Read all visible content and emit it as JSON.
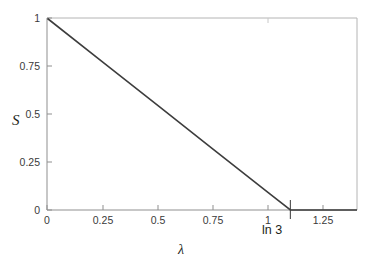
{
  "chart_data": {
    "type": "line",
    "title": "",
    "subtitle": "",
    "xlabel": "λ",
    "ylabel": "S",
    "xlim": [
      0,
      1.4
    ],
    "ylim": [
      0,
      1
    ],
    "grid": false,
    "legend": null,
    "xticks": [
      0,
      0.25,
      0.5,
      0.75,
      1,
      1.25
    ],
    "xticklabels": [
      "0",
      "0.25",
      "0.5",
      "0.75",
      "1",
      "1.25"
    ],
    "yticks": [
      0,
      0.25,
      0.5,
      0.75,
      1
    ],
    "yticklabels": [
      "0",
      "0.25",
      "0.5",
      "0.75",
      "1"
    ],
    "annotations": [
      {
        "text": "ln 3",
        "x": 1.0986,
        "y": 0,
        "note": "tick marking the kink where S reaches zero"
      }
    ],
    "series": [
      {
        "name": "S(λ)",
        "color": "#3d3d3d",
        "linewidth": 1.6,
        "x": [
          0,
          0.25,
          0.5,
          0.75,
          1.0,
          1.0986,
          1.25,
          1.4
        ],
        "values": [
          1.0,
          0.7724,
          0.5448,
          0.3172,
          0.0897,
          0.0,
          0.0,
          0.0
        ]
      }
    ]
  },
  "axes": {
    "spine_color": "#9a9a9a",
    "tick_color": "#9a9a9a",
    "frame": "full-box"
  },
  "labels": {
    "y_axis_title": "S",
    "x_axis_title": "λ",
    "kink_annotation": "ln 3",
    "ytick_1": "1",
    "ytick_075": "0.75",
    "ytick_05": "0.5",
    "ytick_025": "0.25",
    "ytick_0": "0",
    "xtick_0": "0",
    "xtick_025": "0.25",
    "xtick_05": "0.5",
    "xtick_075": "0.75",
    "xtick_1": "1",
    "xtick_125": "1.25"
  }
}
